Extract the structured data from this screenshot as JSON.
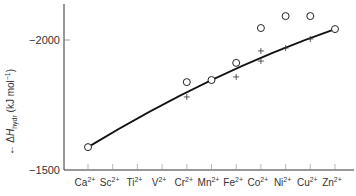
{
  "chart_data": {
    "type": "scatter",
    "title": "",
    "xlabel": "",
    "ylabel": "ΔH_hydr (kJ mol⁻¹)",
    "ylabel_parts": {
      "arrow": "←",
      "delta": "Δ",
      "H": "H",
      "sub": "hydr",
      "unit": "(kJ mol",
      "exp": "−1",
      "close": ")"
    },
    "y_ticks": [
      -2000,
      -1500
    ],
    "y_tick_labels": [
      "−2000",
      "−1500"
    ],
    "ylim": [
      -1500,
      -2150
    ],
    "y_inverted": true,
    "grid": false,
    "categories": [
      {
        "base": "Ca",
        "charge": "2+"
      },
      {
        "base": "Sc",
        "charge": "2+"
      },
      {
        "base": "Ti",
        "charge": "2+"
      },
      {
        "base": "V",
        "charge": "2+"
      },
      {
        "base": "Cr",
        "charge": "2+"
      },
      {
        "base": "Mn",
        "charge": "2+"
      },
      {
        "base": "Fe",
        "charge": "2+"
      },
      {
        "base": "Co",
        "charge": "2+"
      },
      {
        "base": "Ni",
        "charge": "2+"
      },
      {
        "base": "Cu",
        "charge": "2+"
      },
      {
        "base": "Zn",
        "charge": "2+"
      }
    ],
    "series": [
      {
        "name": "experimental (circles)",
        "marker": "open-circle",
        "points": [
          {
            "x": "Ca2+",
            "y": -1588
          },
          {
            "x": "Cr2+",
            "y": -1838
          },
          {
            "x": "Mn2+",
            "y": -1846
          },
          {
            "x": "Fe2+",
            "y": -1912
          },
          {
            "x": "Co2+",
            "y": -2046
          },
          {
            "x": "Ni2+",
            "y": -2092
          },
          {
            "x": "Cu2+",
            "y": -2092
          },
          {
            "x": "Zn2+",
            "y": -2042
          }
        ]
      },
      {
        "name": "corrected (crosses)",
        "marker": "plus",
        "points": [
          {
            "x": "Cr2+",
            "y": -1781
          },
          {
            "x": "Fe2+",
            "y": -1858
          },
          {
            "x": "Co2+",
            "y": -1958
          },
          {
            "x": "Co2+",
            "y": -1919
          },
          {
            "x": "Ni2+",
            "y": -1969
          },
          {
            "x": "Cu2+",
            "y": -2004
          }
        ]
      },
      {
        "name": "trend curve",
        "marker": "line",
        "points": [
          {
            "x": "Ca2+",
            "y": -1588
          },
          {
            "x": "Mn2+",
            "y": -1846
          },
          {
            "x": "Zn2+",
            "y": -2042
          }
        ]
      }
    ]
  }
}
